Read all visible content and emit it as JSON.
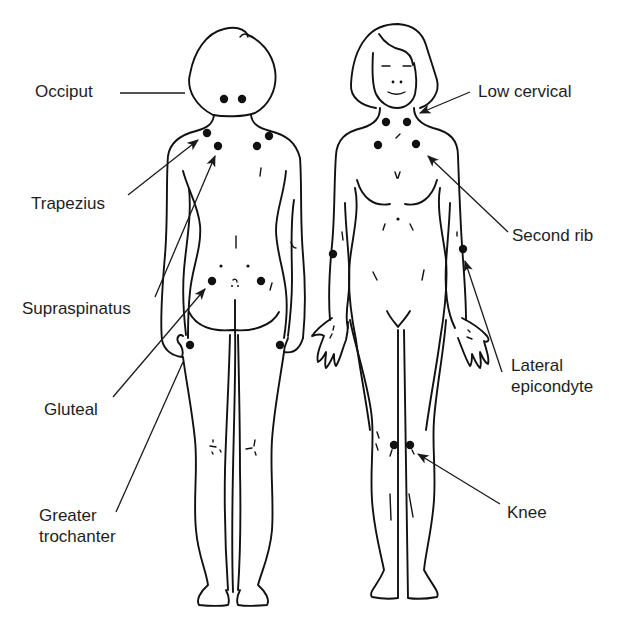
{
  "figure": {
    "figures": [
      {
        "id": "posterior",
        "view": "back view"
      },
      {
        "id": "anterior",
        "view": "front view"
      }
    ]
  },
  "labels": {
    "occiput": "Occiput",
    "trapezius": "Trapezius",
    "supraspinatus": "Supraspinatus",
    "gluteal": "Gluteal",
    "greater_trochanter": [
      "Greater",
      "trochanter"
    ],
    "low_cervical": "Low cervical",
    "second_rib": "Second rib",
    "lateral_epicondyle": [
      "Lateral",
      "epicondyte"
    ],
    "knee": "Knee"
  },
  "tender_points": {
    "posterior": [
      {
        "name": "occiput-left",
        "x": 224,
        "y": 99
      },
      {
        "name": "occiput-right",
        "x": 242,
        "y": 99
      },
      {
        "name": "trapezius-left",
        "x": 207,
        "y": 133
      },
      {
        "name": "trapezius-right",
        "x": 269,
        "y": 136
      },
      {
        "name": "supraspinatus-left",
        "x": 218,
        "y": 146
      },
      {
        "name": "supraspinatus-right",
        "x": 257,
        "y": 146
      },
      {
        "name": "gluteal-left",
        "x": 212,
        "y": 281
      },
      {
        "name": "gluteal-right",
        "x": 261,
        "y": 281
      },
      {
        "name": "trochanter-left",
        "x": 190,
        "y": 345
      },
      {
        "name": "trochanter-right",
        "x": 280,
        "y": 345
      }
    ],
    "anterior": [
      {
        "name": "low-cervical-left",
        "x": 386,
        "y": 122
      },
      {
        "name": "low-cervical-right",
        "x": 407,
        "y": 122
      },
      {
        "name": "second-rib-left",
        "x": 378,
        "y": 145
      },
      {
        "name": "second-rib-right",
        "x": 416,
        "y": 144
      },
      {
        "name": "epicondyle-left",
        "x": 333,
        "y": 254
      },
      {
        "name": "epicondyle-right",
        "x": 463,
        "y": 249
      },
      {
        "name": "knee-left",
        "x": 394,
        "y": 445
      },
      {
        "name": "knee-right",
        "x": 410,
        "y": 445
      }
    ]
  },
  "colors": {
    "ink": "#111111",
    "text": "#1e1e1e",
    "background": "#ffffff"
  }
}
